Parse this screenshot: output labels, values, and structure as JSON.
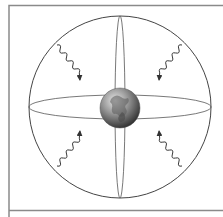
{
  "figure": {
    "frame_color": "#8a8a8a",
    "line_color": "#555555",
    "globe": {
      "label": "Earth",
      "center": [
        120,
        108
      ],
      "radius": 20,
      "colors": {
        "light": "#d8d8d8",
        "mid": "#8f8f8f",
        "dark": "#3a3a3a"
      }
    },
    "sphere": {
      "center": [
        120,
        107
      ],
      "radius": 91
    },
    "waves": [
      {
        "name": "wave-upper-left",
        "direction": "from upper-left toward globe"
      },
      {
        "name": "wave-upper-right",
        "direction": "from upper-right toward globe"
      },
      {
        "name": "wave-lower-left",
        "direction": "from lower-left toward globe"
      },
      {
        "name": "wave-lower-right",
        "direction": "from lower-right toward globe"
      }
    ]
  }
}
